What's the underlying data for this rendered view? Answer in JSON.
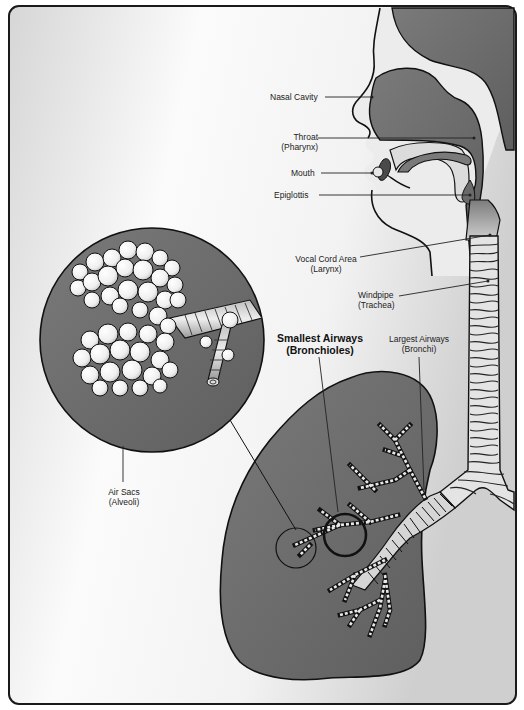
{
  "diagram": {
    "colors": {
      "frame_border": "#1a1a1a",
      "background_light": "#f4f4f4",
      "background_shade": "#d8d8d8",
      "tissue_dark": "#6e6e6e",
      "tissue_mid": "#8a8a8a",
      "airway_light": "#e6e6e6",
      "alveoli_white": "#f7f7f7",
      "outline": "#111111"
    },
    "labels": {
      "nasal_cavity": "Nasal Cavity",
      "throat_line1": "Throat",
      "throat_line2": "(Pharynx)",
      "mouth": "Mouth",
      "epiglottis": "Epiglottis",
      "larynx_line1": "Vocal Cord Area",
      "larynx_line2": "(Larynx)",
      "trachea_line1": "Windpipe",
      "trachea_line2": "(Trachea)",
      "bronchioles_line1": "Smallest Airways",
      "bronchioles_line2": "(Bronchioles)",
      "bronchi_line1": "Largest Airways",
      "bronchi_line2": "(Bronchi)",
      "alveoli_line1": "Air Sacs",
      "alveoli_line2": "(Alveoli)"
    }
  }
}
